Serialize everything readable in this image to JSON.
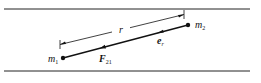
{
  "diagram": {
    "mass1": {
      "label": "m",
      "sub": "1"
    },
    "mass2": {
      "label": "m",
      "sub": "2"
    },
    "distance": {
      "label": "r"
    },
    "force": {
      "label": "F",
      "sub": "21"
    },
    "unit_vector": {
      "label": "e",
      "sub": "r"
    },
    "colors": {
      "stroke": "#111111",
      "background": "#ffffff"
    }
  }
}
